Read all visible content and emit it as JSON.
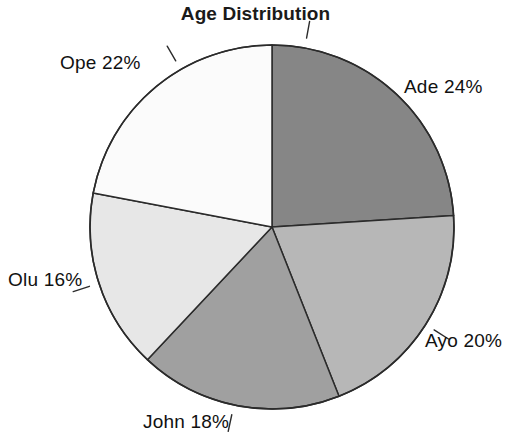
{
  "chart_data": {
    "type": "pie",
    "title": "Age Distribution",
    "xlabel": "",
    "ylabel": "",
    "categories": [
      "Ade",
      "Ayo",
      "John",
      "Olu",
      "Ope"
    ],
    "values": [
      24,
      20,
      18,
      16,
      22
    ],
    "value_unit": "%",
    "labels": [
      "Ade 24%",
      "Ayo 20%",
      "John 18%",
      "Olu 16%",
      "Ope 22%"
    ],
    "legend": "none",
    "grid": false,
    "start_angle_deg": 0,
    "direction": "clockwise",
    "slice_colors": [
      "#868686",
      "#b7b7b7",
      "#a0a0a0",
      "#e7e7e7",
      "#fbfbfb"
    ],
    "outline_color": "#2b2b2b",
    "background": "#ffffff",
    "slices": [
      {
        "name": "Ade",
        "value": 24,
        "label": "Ade 24%",
        "color": "#868686"
      },
      {
        "name": "Ayo",
        "value": 20,
        "label": "Ayo 20%",
        "color": "#b7b7b7"
      },
      {
        "name": "John",
        "value": 18,
        "label": "John 18%",
        "color": "#a0a0a0"
      },
      {
        "name": "Olu",
        "value": 16,
        "label": "Olu 16%",
        "color": "#e7e7e7"
      },
      {
        "name": "Ope",
        "value": 22,
        "label": "Ope 22%",
        "color": "#fbfbfb"
      }
    ]
  }
}
